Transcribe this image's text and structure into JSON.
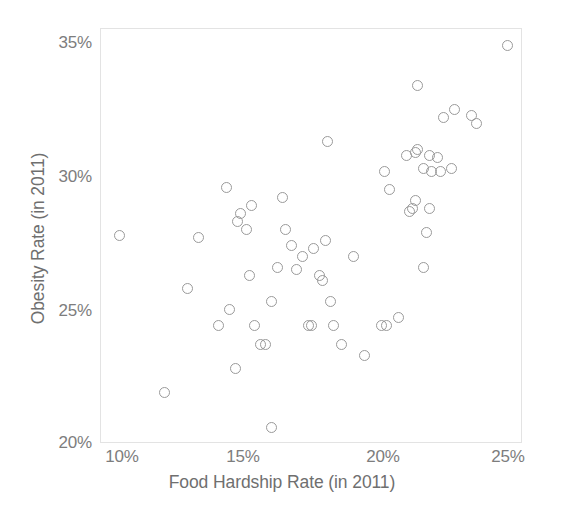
{
  "chart_data": {
    "type": "scatter",
    "title": "",
    "xlabel": "Food Hardship Rate (in 2011)",
    "ylabel": "Obesity Rate (in 2011)",
    "xlim": [
      10,
      25
    ],
    "ylim": [
      20,
      35
    ],
    "xticks": [
      "10%",
      "15%",
      "20%",
      "25%"
    ],
    "xtick_values": [
      10,
      15,
      20,
      25
    ],
    "yticks": [
      "20%",
      "25%",
      "30%",
      "35%"
    ],
    "ytick_values": [
      20,
      25,
      30,
      35
    ],
    "grid": false,
    "legend": null,
    "marker": {
      "shape": "circle-open",
      "stroke_color": "#9a9a9a",
      "fill_color": "none",
      "size_px": 11
    },
    "frame_color": "#e3e3e3",
    "text_color": "#70_7070",
    "point_count": 62,
    "points": [
      {
        "x": 10.7,
        "y": 27.8
      },
      {
        "x": 12.3,
        "y": 21.9
      },
      {
        "x": 13.1,
        "y": 25.8
      },
      {
        "x": 13.5,
        "y": 27.7
      },
      {
        "x": 14.2,
        "y": 24.4
      },
      {
        "x": 14.5,
        "y": 29.6
      },
      {
        "x": 14.6,
        "y": 25.0
      },
      {
        "x": 14.8,
        "y": 22.8
      },
      {
        "x": 14.9,
        "y": 28.3
      },
      {
        "x": 15.0,
        "y": 28.6
      },
      {
        "x": 15.2,
        "y": 28.0
      },
      {
        "x": 15.3,
        "y": 26.3
      },
      {
        "x": 15.4,
        "y": 28.9
      },
      {
        "x": 15.5,
        "y": 24.4
      },
      {
        "x": 15.7,
        "y": 23.7
      },
      {
        "x": 15.9,
        "y": 23.7
      },
      {
        "x": 16.1,
        "y": 20.6
      },
      {
        "x": 16.1,
        "y": 25.3
      },
      {
        "x": 16.3,
        "y": 26.6
      },
      {
        "x": 16.5,
        "y": 29.2
      },
      {
        "x": 16.6,
        "y": 28.0
      },
      {
        "x": 16.8,
        "y": 27.4
      },
      {
        "x": 17.0,
        "y": 26.5
      },
      {
        "x": 17.2,
        "y": 27.0
      },
      {
        "x": 17.4,
        "y": 24.4
      },
      {
        "x": 17.5,
        "y": 24.4
      },
      {
        "x": 17.6,
        "y": 27.3
      },
      {
        "x": 17.8,
        "y": 26.3
      },
      {
        "x": 17.9,
        "y": 26.1
      },
      {
        "x": 18.0,
        "y": 27.6
      },
      {
        "x": 18.1,
        "y": 31.3
      },
      {
        "x": 18.2,
        "y": 25.3
      },
      {
        "x": 18.6,
        "y": 23.7
      },
      {
        "x": 19.0,
        "y": 27.0
      },
      {
        "x": 19.4,
        "y": 23.3
      },
      {
        "x": 20.0,
        "y": 24.4
      },
      {
        "x": 20.1,
        "y": 30.2
      },
      {
        "x": 20.2,
        "y": 24.4
      },
      {
        "x": 20.3,
        "y": 29.5
      },
      {
        "x": 20.6,
        "y": 24.7
      },
      {
        "x": 20.9,
        "y": 30.8
      },
      {
        "x": 21.0,
        "y": 28.7
      },
      {
        "x": 21.1,
        "y": 28.8
      },
      {
        "x": 21.2,
        "y": 29.1
      },
      {
        "x": 21.2,
        "y": 30.9
      },
      {
        "x": 21.3,
        "y": 31.0
      },
      {
        "x": 21.3,
        "y": 33.4
      },
      {
        "x": 21.5,
        "y": 26.6
      },
      {
        "x": 21.5,
        "y": 30.3
      },
      {
        "x": 21.6,
        "y": 27.9
      },
      {
        "x": 21.7,
        "y": 28.8
      },
      {
        "x": 21.7,
        "y": 30.8
      },
      {
        "x": 21.8,
        "y": 30.2
      },
      {
        "x": 22.0,
        "y": 30.7
      },
      {
        "x": 22.1,
        "y": 30.2
      },
      {
        "x": 22.2,
        "y": 32.2
      },
      {
        "x": 22.5,
        "y": 30.3
      },
      {
        "x": 22.6,
        "y": 32.5
      },
      {
        "x": 23.2,
        "y": 32.3
      },
      {
        "x": 23.4,
        "y": 32.0
      },
      {
        "x": 24.5,
        "y": 34.9
      },
      {
        "x": 18.3,
        "y": 24.4
      }
    ]
  }
}
